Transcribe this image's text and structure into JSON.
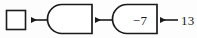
{
  "diagram": {
    "type": "function-machine-chain",
    "reading_direction": "right-to-left",
    "background_color": "#fdfdfd",
    "stroke_color": "#1b1b1b",
    "fill_color": "#ffffff",
    "text_color": "#1b1b1b",
    "answer_box": {
      "label": "",
      "state": "empty"
    },
    "machines": [
      {
        "label": "",
        "state": "empty"
      },
      {
        "label": "−7",
        "state": "filled"
      }
    ],
    "input": {
      "label": "13"
    },
    "arrows": [
      {
        "name": "arrow-to-answer-box",
        "direction": "left"
      },
      {
        "name": "arrow-between-machines",
        "direction": "left"
      },
      {
        "name": "arrow-from-input",
        "direction": "left"
      }
    ]
  }
}
